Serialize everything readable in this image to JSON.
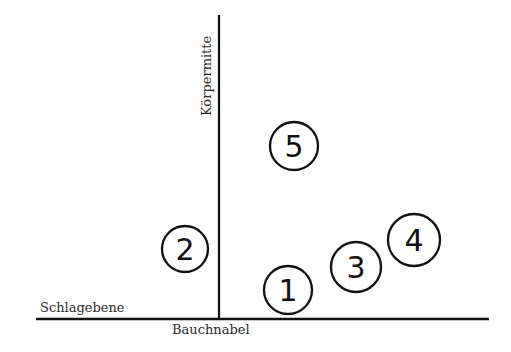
{
  "labels": {
    "vertical_axis": "Körpermitte",
    "horizontal_axis": "Schlagebene",
    "origin": "Bauchnabel"
  },
  "colors": {
    "line": "#111111",
    "text": "#2a2a2a",
    "background": "#ffffff"
  },
  "markers": [
    {
      "id": "1",
      "label": "1",
      "cx": 288,
      "cy": 290,
      "r": 24
    },
    {
      "id": "2",
      "label": "2",
      "cx": 185,
      "cy": 249,
      "r": 23
    },
    {
      "id": "3",
      "label": "3",
      "cx": 356,
      "cy": 267,
      "r": 25
    },
    {
      "id": "4",
      "label": "4",
      "cx": 414,
      "cy": 240,
      "r": 26
    },
    {
      "id": "5",
      "label": "5",
      "cx": 294,
      "cy": 146,
      "r": 24
    }
  ]
}
